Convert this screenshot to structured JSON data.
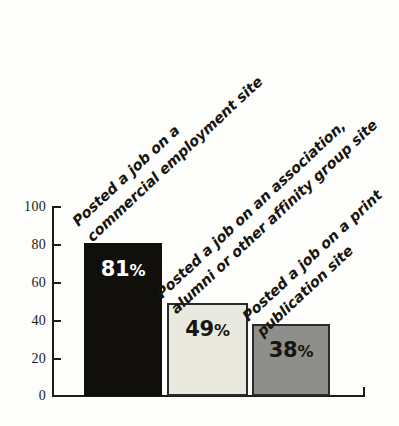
{
  "chart_data": {
    "type": "bar",
    "title": "",
    "subtitle": "",
    "xlabel": "",
    "ylabel": "",
    "ylim": [
      0,
      100
    ],
    "yticks": [
      0,
      20,
      40,
      60,
      80,
      100
    ],
    "grid": false,
    "legend": false,
    "categories": [
      "Posted a job on a commercial employment site",
      "Posted a job on an association, alumni or other affinity group site",
      "Posted a job on a print publication site"
    ],
    "values": [
      81,
      49,
      38
    ],
    "value_labels": [
      "81%",
      "49%",
      "38%"
    ],
    "bars": [
      {
        "label_lines": [
          "Posted a job on a",
          "commercial employment site"
        ],
        "value": 81,
        "value_label": "81%",
        "value_number": "81",
        "value_suffix": "%",
        "fill": "#100f0c",
        "border": "#100f0c",
        "text_color": "#ffffff"
      },
      {
        "label_lines": [
          "Posted a job on an association,",
          "alumni or other affinity group site"
        ],
        "value": 49,
        "value_label": "49%",
        "value_number": "49",
        "value_suffix": "%",
        "fill": "#e9e9e0",
        "border": "#2a2a26",
        "text_color": "#17150f"
      },
      {
        "label_lines": [
          "Posted a job on a print",
          "publication site"
        ],
        "value": 38,
        "value_label": "38%",
        "value_number": "38",
        "value_suffix": "%",
        "fill": "#8e8e8a",
        "border": "#2a2a26",
        "text_color": "#17150f"
      }
    ],
    "colors": {
      "background": "#fdfdfb",
      "axis": "#1b1b19",
      "bar_1": "#100f0c",
      "bar_2": "#e9e9e0",
      "bar_3": "#8e8e8a"
    }
  },
  "axis": {
    "tick_labels": [
      "100",
      "80",
      "60",
      "40",
      "20",
      "0"
    ]
  }
}
